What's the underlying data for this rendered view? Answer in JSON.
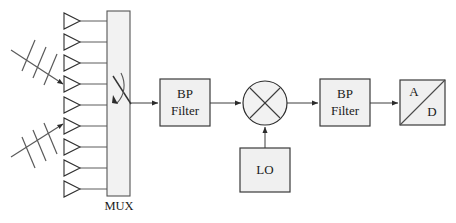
{
  "diagram": {
    "background_color": "#ffffff",
    "block_fill_color": "#f0f0f0",
    "block_border_color": "#3a3a3a",
    "wire_color": "#3c3c3c",
    "text_color": "#1a1a1a"
  },
  "antenna_array": {
    "label": "antenna-array",
    "element_count": 9,
    "element_symbol": "triangle",
    "elements": [
      {
        "index": 1,
        "y": 21
      },
      {
        "index": 2,
        "y": 42
      },
      {
        "index": 3,
        "y": 63
      },
      {
        "index": 4,
        "y": 84
      },
      {
        "index": 5,
        "y": 105
      },
      {
        "index": 6,
        "y": 126
      },
      {
        "index": 7,
        "y": 147
      },
      {
        "index": 8,
        "y": 168
      },
      {
        "index": 9,
        "y": 189
      }
    ]
  },
  "incoming_waves": [
    {
      "name": "incoming-wave-upper",
      "tick_count": 3,
      "direction": "down-right"
    },
    {
      "name": "incoming-wave-lower",
      "tick_count": 3,
      "direction": "up-right"
    }
  ],
  "mux": {
    "label": "MUX",
    "switch": "rotary-selector",
    "x": 107,
    "y": 11,
    "width": 23,
    "height": 185
  },
  "blocks": [
    {
      "id": "bp-filter-1",
      "name": "bp-filter-1",
      "line1": "BP",
      "line2": "Filter",
      "shape": "rectangle",
      "x": 160,
      "y": 79,
      "width": 50,
      "height": 47
    },
    {
      "id": "mixer",
      "name": "mixer",
      "symbol": "circle-with-x",
      "cx": 265,
      "cy": 103,
      "r": 22
    },
    {
      "id": "lo",
      "name": "local-oscillator",
      "line1": "LO",
      "shape": "rectangle",
      "x": 240,
      "y": 148,
      "width": 50,
      "height": 44
    },
    {
      "id": "bp-filter-2",
      "name": "bp-filter-2",
      "line1": "BP",
      "line2": "Filter",
      "shape": "rectangle",
      "x": 320,
      "y": 79,
      "width": 50,
      "height": 47
    },
    {
      "id": "adc",
      "name": "analog-to-digital-converter",
      "label_top": "A",
      "label_bottom": "D",
      "shape": "square-with-diagonal",
      "x": 400,
      "y": 80,
      "width": 45,
      "height": 45
    }
  ],
  "connections": [
    {
      "from": "mux",
      "to": "bp-filter-1",
      "arrow": true
    },
    {
      "from": "bp-filter-1",
      "to": "mixer",
      "arrow": true
    },
    {
      "from": "lo",
      "to": "mixer",
      "arrow": true,
      "orientation": "vertical"
    },
    {
      "from": "mixer",
      "to": "bp-filter-2",
      "arrow": true
    },
    {
      "from": "bp-filter-2",
      "to": "adc",
      "arrow": true
    }
  ]
}
